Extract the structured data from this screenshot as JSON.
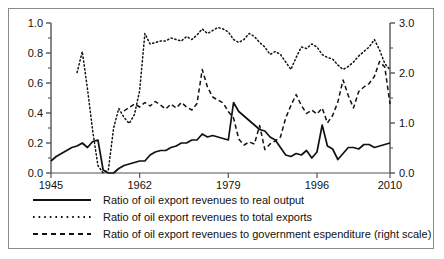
{
  "chart_data": {
    "type": "line",
    "title": "",
    "subtitle": "",
    "xlabel": "",
    "ylabel": "",
    "xlim": [
      1945,
      2010
    ],
    "ylim": [
      0.0,
      1.0
    ],
    "y2lim": [
      0.0,
      3.0
    ],
    "grid": false,
    "legend_position": "bottom-left",
    "x_ticks": [
      "1945",
      "1962",
      "1979",
      "1996",
      "2010"
    ],
    "x_tick_values": [
      1945,
      1962,
      1979,
      1996,
      2010
    ],
    "y_ticks_left": [
      "0.0",
      "0.2",
      "0.4",
      "0.6",
      "0.8",
      "1.0"
    ],
    "y_tick_values_left": [
      0.0,
      0.2,
      0.4,
      0.6,
      0.8,
      1.0
    ],
    "y_minor_left": [
      0.1,
      0.3,
      0.5,
      0.7,
      0.9
    ],
    "y_ticks_right": [
      "0.0",
      "1.0",
      "2.0",
      "3.0"
    ],
    "y_tick_values_right": [
      0.0,
      1.0,
      2.0,
      3.0
    ],
    "y_minor_right": [
      0.5,
      1.5,
      2.5
    ],
    "series": [
      {
        "name": "Ratio of oil export revenues to real output",
        "style": "solid",
        "axis": "left",
        "color": "#111111",
        "x": [
          1945,
          1946,
          1947,
          1948,
          1949,
          1950,
          1951,
          1952,
          1953,
          1954,
          1955,
          1956,
          1957,
          1958,
          1959,
          1960,
          1961,
          1962,
          1963,
          1964,
          1965,
          1966,
          1967,
          1968,
          1969,
          1970,
          1971,
          1972,
          1973,
          1974,
          1975,
          1976,
          1977,
          1978,
          1979,
          1980,
          1981,
          1982,
          1983,
          1984,
          1985,
          1986,
          1987,
          1988,
          1989,
          1990,
          1991,
          1992,
          1993,
          1994,
          1995,
          1996,
          1997,
          1998,
          1999,
          2000,
          2001,
          2002,
          2003,
          2004,
          2005,
          2006,
          2007,
          2008,
          2009,
          2010
        ],
        "values": [
          0.08,
          0.11,
          0.13,
          0.15,
          0.17,
          0.18,
          0.2,
          0.17,
          0.21,
          0.22,
          0.02,
          0.0,
          0.0,
          0.03,
          0.05,
          0.06,
          0.07,
          0.08,
          0.08,
          0.12,
          0.14,
          0.15,
          0.15,
          0.17,
          0.18,
          0.2,
          0.2,
          0.22,
          0.22,
          0.26,
          0.24,
          0.25,
          0.24,
          0.23,
          0.22,
          0.47,
          0.41,
          0.38,
          0.35,
          0.32,
          0.29,
          0.28,
          0.24,
          0.22,
          0.17,
          0.12,
          0.11,
          0.13,
          0.12,
          0.15,
          0.1,
          0.14,
          0.32,
          0.18,
          0.16,
          0.09,
          0.13,
          0.17,
          0.17,
          0.16,
          0.19,
          0.19,
          0.17,
          0.18,
          0.19,
          0.2
        ]
      },
      {
        "name": "Ratio of oil export revenues to total exports",
        "style": "dotted",
        "axis": "left",
        "color": "#111111",
        "x": [
          1950,
          1951,
          1952,
          1953,
          1954,
          1955,
          1956,
          1957,
          1958,
          1959,
          1960,
          1961,
          1962,
          1963,
          1964,
          1965,
          1966,
          1967,
          1968,
          1969,
          1970,
          1971,
          1972,
          1973,
          1974,
          1975,
          1976,
          1977,
          1978,
          1979,
          1980,
          1981,
          1982,
          1983,
          1984,
          1985,
          1986,
          1987,
          1988,
          1989,
          1990,
          1991,
          1992,
          1993,
          1994,
          1995,
          1996,
          1997,
          1998,
          1999,
          2000,
          2001,
          2002,
          2003,
          2004,
          2005,
          2006,
          2007,
          2008,
          2009,
          2010
        ],
        "values": [
          0.67,
          0.81,
          0.56,
          0.28,
          0.05,
          0.0,
          0.02,
          0.3,
          0.43,
          0.37,
          0.33,
          0.39,
          0.55,
          0.93,
          0.86,
          0.87,
          0.88,
          0.88,
          0.9,
          0.89,
          0.88,
          0.91,
          0.89,
          0.92,
          0.96,
          0.93,
          0.95,
          0.97,
          0.96,
          0.94,
          0.89,
          0.87,
          0.89,
          0.93,
          0.91,
          0.87,
          0.84,
          0.79,
          0.81,
          0.79,
          0.74,
          0.69,
          0.77,
          0.84,
          0.83,
          0.86,
          0.84,
          0.79,
          0.77,
          0.76,
          0.72,
          0.69,
          0.71,
          0.74,
          0.78,
          0.81,
          0.84,
          0.89,
          0.82,
          0.73,
          0.69
        ]
      },
      {
        "name": "Ratio of oil export revenues to government espenditure (right scale)",
        "style": "dashed",
        "axis": "right",
        "color": "#111111",
        "x": [
          1959,
          1960,
          1961,
          1962,
          1963,
          1964,
          1965,
          1966,
          1967,
          1968,
          1969,
          1970,
          1971,
          1972,
          1973,
          1974,
          1975,
          1976,
          1977,
          1978,
          1979,
          1980,
          1981,
          1982,
          1983,
          1984,
          1985,
          1986,
          1987,
          1988,
          1989,
          1990,
          1991,
          1992,
          1993,
          1994,
          1995,
          1996,
          1997,
          1998,
          1999,
          2000,
          2001,
          2002,
          2003,
          2004,
          2005,
          2006,
          2007,
          2008,
          2009,
          2010
        ],
        "values": [
          1.24,
          1.31,
          1.38,
          1.32,
          1.41,
          1.34,
          1.43,
          1.36,
          1.28,
          1.38,
          1.3,
          1.41,
          1.32,
          1.26,
          1.39,
          2.07,
          1.72,
          1.52,
          1.46,
          1.4,
          1.23,
          1.1,
          0.68,
          0.56,
          0.62,
          0.58,
          0.95,
          0.47,
          0.58,
          0.64,
          0.72,
          1.1,
          1.35,
          1.57,
          1.35,
          1.19,
          1.26,
          1.18,
          1.3,
          1.0,
          1.15,
          1.42,
          1.86,
          1.55,
          1.3,
          1.63,
          1.72,
          1.79,
          1.93,
          2.23,
          2.12,
          1.38
        ]
      }
    ]
  },
  "legend": {
    "items": [
      {
        "label": "Ratio of oil export revenues to real output",
        "style": "solid"
      },
      {
        "label": "Ratio of oil export revenues to total exports",
        "style": "dotted"
      },
      {
        "label": "Ratio of oil export revenues to government espenditure (right scale)",
        "style": "dashed"
      }
    ]
  },
  "colors": {
    "ink": "#111111",
    "frame": "#8a8a8a",
    "axis": "#555555",
    "background": "#ffffff"
  }
}
